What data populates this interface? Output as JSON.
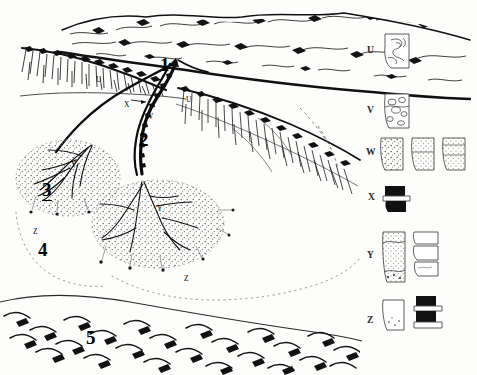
{
  "figure": {
    "type": "geomorphological-block-diagram",
    "style": "pen-and-ink line drawing",
    "background_color": "#fdfdfc",
    "ink_color": "#111111"
  },
  "diagram_labels": {
    "numbers": [
      {
        "id": "1",
        "text": "1",
        "x": 160,
        "y": 55,
        "underlined": false,
        "note": "gully head / apex of channel system"
      },
      {
        "id": "2",
        "text": "2",
        "x": 139,
        "y": 130,
        "underlined": false,
        "note": "incised main channel"
      },
      {
        "id": "3",
        "text": "3",
        "x": 42,
        "y": 180,
        "underlined": true,
        "note": "left depositional fan"
      },
      {
        "id": "4",
        "text": "4",
        "x": 38,
        "y": 240,
        "underlined": false,
        "note": "distal apron"
      },
      {
        "id": "5",
        "text": "5",
        "x": 86,
        "y": 328,
        "underlined": false,
        "note": "foreground textured slope"
      }
    ],
    "letters": [
      {
        "id": "u-left",
        "text": "U",
        "x": 96,
        "y": 76,
        "size": "sm"
      },
      {
        "id": "u-right",
        "text": "U",
        "x": 186,
        "y": 96,
        "size": "sm"
      },
      {
        "id": "x-scarp",
        "text": "X",
        "x": 124,
        "y": 101,
        "size": "sm"
      },
      {
        "id": "w-channel",
        "text": "W",
        "x": 146,
        "y": 113,
        "size": "sm"
      },
      {
        "id": "y-left-fan",
        "text": "Y",
        "x": 71,
        "y": 161,
        "size": "sm"
      },
      {
        "id": "y-center-fan",
        "text": "Y",
        "x": 157,
        "y": 205,
        "size": "sm"
      },
      {
        "id": "z-left",
        "text": "Z",
        "x": 33,
        "y": 228,
        "size": "sm"
      },
      {
        "id": "z-center",
        "text": "Z",
        "x": 184,
        "y": 275,
        "size": "sm"
      }
    ]
  },
  "legend": {
    "rows": [
      {
        "letter": "U",
        "y": 50,
        "samples": 1,
        "pattern": "swirled-folded",
        "description": "folded / contorted bedrock"
      },
      {
        "letter": "V",
        "y": 110,
        "samples": 1,
        "pattern": "clasts-ovoid",
        "description": "coarse clast-supported conglomerate"
      },
      {
        "letter": "W",
        "y": 152,
        "samples": 3,
        "pattern": "stippled-dense",
        "description": "stratified sandy gravel, three columns"
      },
      {
        "letter": "X",
        "y": 197,
        "samples": 1,
        "pattern": "solid-dark-blocks",
        "description": "dark massive unit"
      },
      {
        "letter": "Y",
        "y": 255,
        "samples": 2,
        "pattern": "stippled-light-blocky",
        "description": "stippled fan deposits and blocky beds"
      },
      {
        "letter": "Z",
        "y": 320,
        "samples": 2,
        "pattern": "pale-and-dark-blocks",
        "description": "pale distal deposit and dark banded unit"
      }
    ]
  }
}
